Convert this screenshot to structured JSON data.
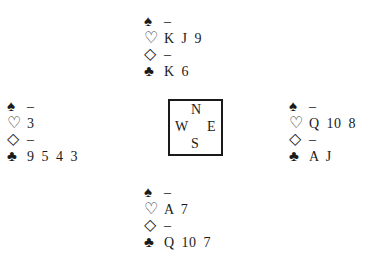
{
  "suits": {
    "spades": "♠",
    "hearts": "♡",
    "diamonds": "◇",
    "clubs": "♣"
  },
  "compass": {
    "n": "N",
    "w": "W",
    "e": "E",
    "s": "S"
  },
  "hands": {
    "north": {
      "spades": "–",
      "hearts": "K J 9",
      "diamonds": "–",
      "clubs": "K 6"
    },
    "west": {
      "spades": "–",
      "hearts": "3",
      "diamonds": "–",
      "clubs": "9 5 4 3"
    },
    "east": {
      "spades": "–",
      "hearts": "Q 10 8",
      "diamonds": "–",
      "clubs": "A J"
    },
    "south": {
      "spades": "–",
      "hearts": "A 7",
      "diamonds": "–",
      "clubs": "Q 10 7"
    }
  }
}
